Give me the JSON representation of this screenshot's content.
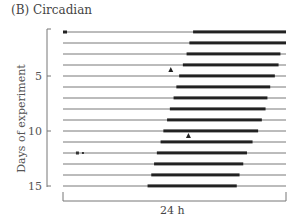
{
  "figure": {
    "title": "(B) Circadian",
    "ylabel": "Days of experiment",
    "xlabel": "24 h"
  },
  "chart_data": {
    "type": "actogram",
    "title": "(B) Circadian",
    "xlabel": "24 h",
    "ylabel": "Days of experiment",
    "y_ticks": [
      5,
      10,
      15
    ],
    "ylim": [
      1,
      15
    ],
    "x_range_hours": [
      0,
      24
    ],
    "days": [
      {
        "day": 1,
        "active_start_h": 14.0,
        "active_end_h": 24.0
      },
      {
        "day": 2,
        "active_start_h": 13.6,
        "active_end_h": 24.0
      },
      {
        "day": 3,
        "active_start_h": 13.3,
        "active_end_h": 23.4
      },
      {
        "day": 4,
        "active_start_h": 12.9,
        "active_end_h": 23.2
      },
      {
        "day": 5,
        "active_start_h": 12.5,
        "active_end_h": 22.8
      },
      {
        "day": 6,
        "active_start_h": 12.2,
        "active_end_h": 22.3
      },
      {
        "day": 7,
        "active_start_h": 11.9,
        "active_end_h": 22.0
      },
      {
        "day": 8,
        "active_start_h": 11.5,
        "active_end_h": 21.8
      },
      {
        "day": 9,
        "active_start_h": 11.2,
        "active_end_h": 21.4
      },
      {
        "day": 10,
        "active_start_h": 10.8,
        "active_end_h": 21.0
      },
      {
        "day": 11,
        "active_start_h": 10.5,
        "active_end_h": 20.4
      },
      {
        "day": 12,
        "active_start_h": 10.1,
        "active_end_h": 19.8
      },
      {
        "day": 13,
        "active_start_h": 9.8,
        "active_end_h": 19.4
      },
      {
        "day": 14,
        "active_start_h": 9.5,
        "active_end_h": 19.0
      },
      {
        "day": 15,
        "active_start_h": 9.1,
        "active_end_h": 18.7
      }
    ],
    "annotations": [
      {
        "type": "arrow-up",
        "day": 4,
        "hour": 11.6
      },
      {
        "type": "arrow-up",
        "day": 10,
        "hour": 13.5
      },
      {
        "type": "mark",
        "day": 12,
        "hour": 1.5
      }
    ],
    "trend": "activity onset advances ~0.35 h per day (free-running period < 24 h)"
  }
}
